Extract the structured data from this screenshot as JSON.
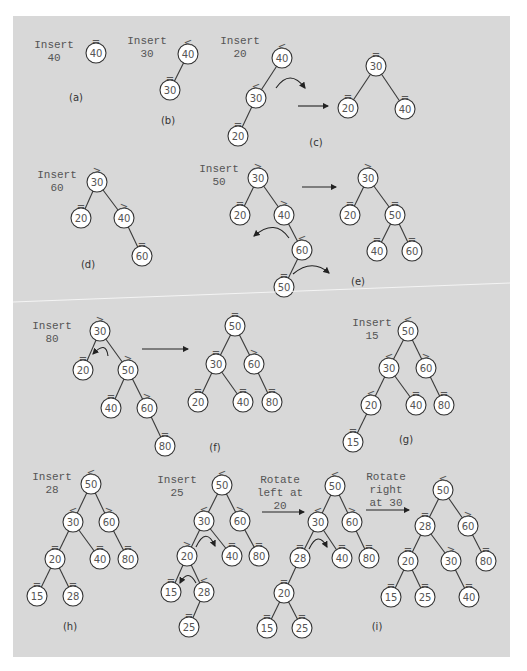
{
  "figure": {
    "background": "#d8d8d8",
    "node_fill": "#ffffff",
    "stroke": "#333333"
  },
  "panels": [
    {
      "id": "a",
      "tag": "(a)",
      "tag_pos": [
        76,
        101
      ],
      "captions": [
        {
          "lines": [
            "Insert",
            "40"
          ],
          "x": 54,
          "y": 48
        }
      ],
      "nodes": [
        {
          "v": "40",
          "x": 96,
          "y": 53,
          "b": "="
        }
      ],
      "edges": [],
      "arrows": [],
      "curves": []
    },
    {
      "id": "b",
      "tag": "(b)",
      "tag_pos": [
        168,
        124
      ],
      "captions": [
        {
          "lines": [
            "Insert",
            "30"
          ],
          "x": 147,
          "y": 44
        }
      ],
      "nodes": [
        {
          "v": "40",
          "x": 188,
          "y": 54,
          "b": "<"
        },
        {
          "v": "30",
          "x": 170,
          "y": 90,
          "b": "="
        }
      ],
      "edges": [
        [
          0,
          1
        ]
      ],
      "arrows": [],
      "curves": []
    },
    {
      "id": "c",
      "tag": "(c)",
      "tag_pos": [
        316,
        146
      ],
      "captions": [
        {
          "lines": [
            "Insert",
            "20"
          ],
          "x": 240,
          "y": 44
        }
      ],
      "nodes": [
        {
          "v": "40",
          "x": 282,
          "y": 58,
          "b": "<"
        },
        {
          "v": "30",
          "x": 256,
          "y": 98,
          "b": "<"
        },
        {
          "v": "20",
          "x": 238,
          "y": 136,
          "b": "="
        },
        {
          "v": "30",
          "x": 376,
          "y": 66,
          "b": "="
        },
        {
          "v": "20",
          "x": 348,
          "y": 108,
          "b": "="
        },
        {
          "v": "40",
          "x": 405,
          "y": 109,
          "b": "="
        }
      ],
      "edges": [
        [
          0,
          1
        ],
        [
          1,
          2
        ],
        [
          3,
          4
        ],
        [
          3,
          5
        ]
      ],
      "arrows": [
        [
          298,
          106,
          328,
          106
        ]
      ],
      "curves": [
        {
          "d": "M276 88 Q290 68 305 88",
          "head": [
            305,
            88
          ]
        }
      ]
    },
    {
      "id": "d",
      "tag": "(d)",
      "tag_pos": [
        88,
        268
      ],
      "captions": [
        {
          "lines": [
            "Insert",
            "60"
          ],
          "x": 57,
          "y": 178
        }
      ],
      "nodes": [
        {
          "v": "30",
          "x": 97,
          "y": 182,
          "b": ">"
        },
        {
          "v": "20",
          "x": 81,
          "y": 218,
          "b": "="
        },
        {
          "v": "40",
          "x": 124,
          "y": 218,
          "b": ">"
        },
        {
          "v": "60",
          "x": 142,
          "y": 256,
          "b": "="
        }
      ],
      "edges": [
        [
          0,
          1
        ],
        [
          0,
          2
        ],
        [
          2,
          3
        ]
      ],
      "arrows": [],
      "curves": []
    },
    {
      "id": "e",
      "tag": "(e)",
      "tag_pos": [
        358,
        285
      ],
      "captions": [
        {
          "lines": [
            "Insert",
            "50"
          ],
          "x": 219,
          "y": 172
        }
      ],
      "nodes": [
        {
          "v": "30",
          "x": 258,
          "y": 178,
          "b": ">"
        },
        {
          "v": "20",
          "x": 240,
          "y": 215,
          "b": "="
        },
        {
          "v": "40",
          "x": 284,
          "y": 215,
          "b": ">"
        },
        {
          "v": "60",
          "x": 302,
          "y": 250,
          "b": "<"
        },
        {
          "v": "50",
          "x": 284,
          "y": 287,
          "b": "="
        },
        {
          "v": "30",
          "x": 368,
          "y": 178,
          "b": ">"
        },
        {
          "v": "20",
          "x": 350,
          "y": 215,
          "b": "="
        },
        {
          "v": "50",
          "x": 395,
          "y": 215,
          "b": "="
        },
        {
          "v": "40",
          "x": 377,
          "y": 251,
          "b": "="
        },
        {
          "v": "60",
          "x": 412,
          "y": 251,
          "b": "="
        }
      ],
      "edges": [
        [
          0,
          1
        ],
        [
          0,
          2
        ],
        [
          2,
          3
        ],
        [
          3,
          4
        ],
        [
          5,
          6
        ],
        [
          5,
          7
        ],
        [
          7,
          8
        ],
        [
          7,
          9
        ]
      ],
      "arrows": [
        [
          302,
          187,
          336,
          187
        ]
      ],
      "curves": [
        {
          "d": "M289 238 Q275 218 254 236",
          "head": [
            254,
            236
          ]
        },
        {
          "d": "M293 274 Q312 258 329 273",
          "head": [
            329,
            273
          ]
        }
      ]
    },
    {
      "id": "f",
      "tag": "(f)",
      "tag_pos": [
        215,
        451
      ],
      "captions": [
        {
          "lines": [
            "Insert",
            "80"
          ],
          "x": 52,
          "y": 329
        }
      ],
      "nodes": [
        {
          "v": "30",
          "x": 100,
          "y": 331,
          "b": ">"
        },
        {
          "v": "20",
          "x": 83,
          "y": 370,
          "b": "="
        },
        {
          "v": "50",
          "x": 128,
          "y": 370,
          "b": ">"
        },
        {
          "v": "40",
          "x": 111,
          "y": 408,
          "b": "="
        },
        {
          "v": "60",
          "x": 147,
          "y": 408,
          "b": ">"
        },
        {
          "v": "80",
          "x": 165,
          "y": 446,
          "b": "="
        },
        {
          "v": "50",
          "x": 235,
          "y": 326,
          "b": "="
        },
        {
          "v": "30",
          "x": 216,
          "y": 364,
          "b": "="
        },
        {
          "v": "60",
          "x": 254,
          "y": 364,
          "b": ">"
        },
        {
          "v": "20",
          "x": 198,
          "y": 402,
          "b": "="
        },
        {
          "v": "40",
          "x": 243,
          "y": 402,
          "b": "="
        },
        {
          "v": "80",
          "x": 272,
          "y": 402,
          "b": "="
        }
      ],
      "edges": [
        [
          0,
          1
        ],
        [
          0,
          2
        ],
        [
          2,
          3
        ],
        [
          2,
          4
        ],
        [
          4,
          5
        ],
        [
          6,
          7
        ],
        [
          6,
          8
        ],
        [
          7,
          9
        ],
        [
          7,
          10
        ],
        [
          8,
          11
        ]
      ],
      "arrows": [
        [
          142,
          349,
          188,
          349
        ]
      ],
      "curves": [
        {
          "d": "M108 356 Q106 340 93 354",
          "head": [
            93,
            354
          ]
        }
      ]
    },
    {
      "id": "g",
      "tag": "(g)",
      "tag_pos": [
        406,
        443
      ],
      "captions": [
        {
          "lines": [
            "Insert",
            "15"
          ],
          "x": 372,
          "y": 326
        }
      ],
      "nodes": [
        {
          "v": "50",
          "x": 408,
          "y": 331,
          "b": "<"
        },
        {
          "v": "30",
          "x": 389,
          "y": 368,
          "b": "<"
        },
        {
          "v": "60",
          "x": 426,
          "y": 368,
          "b": ">"
        },
        {
          "v": "20",
          "x": 371,
          "y": 405,
          "b": "<"
        },
        {
          "v": "40",
          "x": 416,
          "y": 405,
          "b": "="
        },
        {
          "v": "80",
          "x": 444,
          "y": 405,
          "b": "="
        },
        {
          "v": "15",
          "x": 353,
          "y": 442,
          "b": "="
        }
      ],
      "edges": [
        [
          0,
          1
        ],
        [
          0,
          2
        ],
        [
          1,
          3
        ],
        [
          1,
          4
        ],
        [
          2,
          5
        ],
        [
          3,
          6
        ]
      ],
      "arrows": [],
      "curves": []
    },
    {
      "id": "h",
      "tag": "(h)",
      "tag_pos": [
        70,
        630
      ],
      "captions": [
        {
          "lines": [
            "Insert",
            "28"
          ],
          "x": 52,
          "y": 480
        }
      ],
      "nodes": [
        {
          "v": "50",
          "x": 91,
          "y": 484,
          "b": "<"
        },
        {
          "v": "30",
          "x": 73,
          "y": 522,
          "b": "<"
        },
        {
          "v": "60",
          "x": 109,
          "y": 522,
          "b": ">"
        },
        {
          "v": "20",
          "x": 55,
          "y": 559,
          "b": "="
        },
        {
          "v": "40",
          "x": 100,
          "y": 559,
          "b": "="
        },
        {
          "v": "80",
          "x": 128,
          "y": 559,
          "b": "="
        },
        {
          "v": "15",
          "x": 37,
          "y": 596,
          "b": "="
        },
        {
          "v": "28",
          "x": 73,
          "y": 596,
          "b": "="
        }
      ],
      "edges": [
        [
          0,
          1
        ],
        [
          0,
          2
        ],
        [
          1,
          3
        ],
        [
          1,
          4
        ],
        [
          2,
          5
        ],
        [
          3,
          6
        ],
        [
          3,
          7
        ]
      ],
      "arrows": [],
      "curves": []
    },
    {
      "id": "i",
      "tag": "(i)",
      "tag_pos": [
        377,
        630
      ],
      "captions": [
        {
          "lines": [
            "Insert",
            "25"
          ],
          "x": 177,
          "y": 483
        },
        {
          "lines": [
            "Rotate",
            "left at",
            "20"
          ],
          "x": 280,
          "y": 483
        },
        {
          "lines": [
            "Rotate",
            "right",
            "at 30"
          ],
          "x": 386,
          "y": 480
        }
      ],
      "nodes": [
        {
          "v": "50",
          "x": 222,
          "y": 485,
          "b": "<"
        },
        {
          "v": "30",
          "x": 204,
          "y": 521,
          "b": "<"
        },
        {
          "v": "60",
          "x": 240,
          "y": 521,
          "b": ">"
        },
        {
          "v": "20",
          "x": 187,
          "y": 556,
          "b": ">"
        },
        {
          "v": "40",
          "x": 232,
          "y": 556,
          "b": "="
        },
        {
          "v": "80",
          "x": 259,
          "y": 556,
          "b": "="
        },
        {
          "v": "15",
          "x": 171,
          "y": 592,
          "b": "="
        },
        {
          "v": "28",
          "x": 204,
          "y": 592,
          "b": "<"
        },
        {
          "v": "25",
          "x": 189,
          "y": 627,
          "b": "="
        },
        {
          "v": "50",
          "x": 335,
          "y": 486,
          "b": "<"
        },
        {
          "v": "30",
          "x": 318,
          "y": 522,
          "b": "<"
        },
        {
          "v": "60",
          "x": 352,
          "y": 522,
          "b": ">"
        },
        {
          "v": "28",
          "x": 300,
          "y": 558,
          "b": "="
        },
        {
          "v": "40",
          "x": 342,
          "y": 558,
          "b": "="
        },
        {
          "v": "80",
          "x": 369,
          "y": 558,
          "b": "="
        },
        {
          "v": "20",
          "x": 284,
          "y": 593,
          "b": "="
        },
        {
          "v": "15",
          "x": 267,
          "y": 628,
          "b": "="
        },
        {
          "v": "25",
          "x": 302,
          "y": 628,
          "b": "="
        },
        {
          "v": "50",
          "x": 443,
          "y": 490,
          "b": "<"
        },
        {
          "v": "28",
          "x": 425,
          "y": 526,
          "b": "="
        },
        {
          "v": "60",
          "x": 468,
          "y": 526,
          "b": ">"
        },
        {
          "v": "20",
          "x": 408,
          "y": 561,
          "b": "="
        },
        {
          "v": "30",
          "x": 451,
          "y": 561,
          "b": ">"
        },
        {
          "v": "80",
          "x": 486,
          "y": 561,
          "b": "="
        },
        {
          "v": "15",
          "x": 391,
          "y": 597,
          "b": "="
        },
        {
          "v": "25",
          "x": 425,
          "y": 597,
          "b": "="
        },
        {
          "v": "40",
          "x": 469,
          "y": 597,
          "b": "="
        }
      ],
      "edges": [
        [
          0,
          1
        ],
        [
          0,
          2
        ],
        [
          1,
          3
        ],
        [
          1,
          4
        ],
        [
          2,
          5
        ],
        [
          3,
          6
        ],
        [
          3,
          7
        ],
        [
          7,
          8
        ],
        [
          9,
          10
        ],
        [
          9,
          11
        ],
        [
          10,
          12
        ],
        [
          10,
          13
        ],
        [
          11,
          14
        ],
        [
          12,
          15
        ],
        [
          15,
          16
        ],
        [
          15,
          17
        ],
        [
          18,
          19
        ],
        [
          18,
          20
        ],
        [
          19,
          21
        ],
        [
          19,
          22
        ],
        [
          20,
          23
        ],
        [
          21,
          24
        ],
        [
          21,
          25
        ],
        [
          22,
          26
        ]
      ],
      "arrows": [
        [
          262,
          512,
          304,
          512
        ],
        [
          366,
          510,
          409,
          510
        ]
      ],
      "curves": [
        {
          "d": "M196 547 Q206 526 215 546",
          "head": [
            215,
            546
          ]
        },
        {
          "d": "M196 583 Q188 568 180 583",
          "head": [
            180,
            583
          ]
        },
        {
          "d": "M309 549 Q318 530 327 547",
          "head": [
            327,
            547
          ]
        }
      ]
    }
  ],
  "scan_line": [
    13,
    302,
    510,
    283
  ]
}
